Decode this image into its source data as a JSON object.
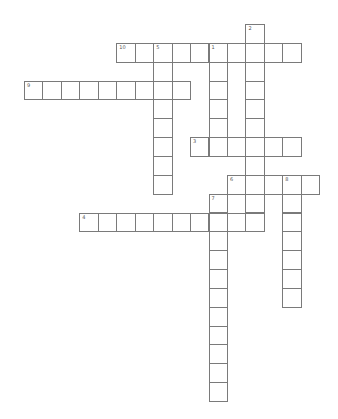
{
  "puzzle": {
    "title": "",
    "grid": {
      "origin_x": 24,
      "origin_y": 24,
      "cell_w": 18.45,
      "cell_h": 18.85,
      "line_color": "#7a7a7a",
      "fill_color": "#ffffff"
    },
    "words": [
      {
        "number": "1",
        "direction": "down",
        "row": 1,
        "col": 10,
        "length": 6
      },
      {
        "number": "2",
        "direction": "down",
        "row": 0,
        "col": 12,
        "length": 11
      },
      {
        "number": "3",
        "direction": "across",
        "row": 6,
        "col": 9,
        "length": 6
      },
      {
        "number": "4",
        "direction": "across",
        "row": 10,
        "col": 3,
        "length": 10
      },
      {
        "number": "5",
        "direction": "down",
        "row": 1,
        "col": 7,
        "length": 8
      },
      {
        "number": "6",
        "direction": "across",
        "row": 8,
        "col": 11,
        "length": 5
      },
      {
        "number": "7",
        "direction": "down",
        "row": 9,
        "col": 10,
        "length": 11
      },
      {
        "number": "8",
        "direction": "down",
        "row": 8,
        "col": 14,
        "length": 7
      },
      {
        "number": "9",
        "direction": "across",
        "row": 3,
        "col": 0,
        "length": 9
      },
      {
        "number": "10",
        "direction": "across",
        "row": 1,
        "col": 5,
        "length": 10
      }
    ]
  }
}
